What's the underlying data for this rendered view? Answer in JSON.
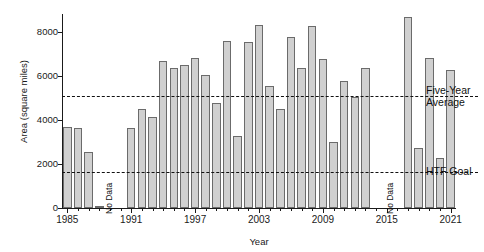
{
  "chart_data": {
    "type": "bar",
    "title": "",
    "xlabel": "Year",
    "ylabel": "Area (square miles)",
    "ylim": [
      0,
      9000
    ],
    "yticks": [
      0,
      2000,
      4000,
      6000,
      8000
    ],
    "ytick_labels": [
      "0",
      "2000",
      "4000",
      "6000",
      "8000"
    ],
    "xlim": [
      1984.5,
      2021.5
    ],
    "xticks": [
      1985,
      1991,
      1997,
      2003,
      2009,
      2015,
      2021
    ],
    "xtick_labels": [
      "1985",
      "1991",
      "1997",
      "2003",
      "2009",
      "2015",
      "2021"
    ],
    "grid": false,
    "legend_position": "right-inside",
    "bar_fill_color": "#d0d0d0",
    "bar_edge_color": "#6b6b6b",
    "categories": [
      1985,
      1986,
      1987,
      1988,
      1989,
      1990,
      1991,
      1992,
      1993,
      1994,
      1995,
      1996,
      1997,
      1998,
      1999,
      2000,
      2001,
      2002,
      2003,
      2004,
      2005,
      2006,
      2007,
      2008,
      2009,
      2010,
      2011,
      2012,
      2013,
      2014,
      2015,
      2016,
      2017,
      2018,
      2019,
      2020,
      2021
    ],
    "values": [
      3750,
      3730,
      2600,
      30,
      null,
      null,
      3700,
      4600,
      4200,
      6800,
      6500,
      6650,
      6950,
      6150,
      4850,
      7750,
      3350,
      7700,
      8500,
      5650,
      4600,
      7950,
      6500,
      8450,
      6900,
      3050,
      5900,
      5150,
      6500,
      null,
      null,
      null,
      8850,
      2800,
      6950,
      2300,
      6400
    ],
    "annotations": [
      {
        "name": "no-data-1989",
        "text": "No Data",
        "x_year": 1989,
        "orientation": "vertical"
      },
      {
        "name": "no-data-2015",
        "text": "No Data",
        "x_year": 2015.4,
        "orientation": "vertical"
      }
    ],
    "reference_lines": [
      {
        "name": "five-year-average",
        "label": "Five-Year Average",
        "value": 5200,
        "style": "dashed"
      },
      {
        "name": "htf-goal",
        "label": "HTF Goal",
        "value": 1650,
        "style": "dashed"
      }
    ]
  },
  "labels": {
    "five_year_average_line1": "Five-Year",
    "five_year_average_line2": "Average",
    "htf_goal": "HTF Goal",
    "no_data": "No Data"
  }
}
